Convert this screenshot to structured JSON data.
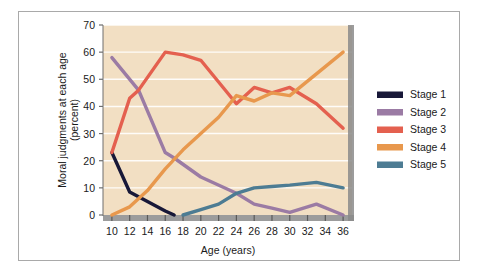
{
  "chart_data": {
    "type": "line",
    "title": "",
    "xlabel": "Age (years)",
    "ylabel": "Moral judgments at each age (percent)",
    "ylabel_line1": "Moral judgments at each age",
    "ylabel_line2": "(percent)",
    "xlim": [
      9,
      37
    ],
    "ylim": [
      0,
      70
    ],
    "xticks": [
      10,
      12,
      14,
      16,
      18,
      20,
      22,
      24,
      26,
      28,
      30,
      32,
      34,
      36
    ],
    "xtick_labels": [
      "10",
      "12",
      "14",
      "16",
      "18",
      "20",
      "22",
      "24",
      "26",
      "28",
      "30",
      "32",
      "34",
      "36"
    ],
    "yticks": [
      0,
      10,
      20,
      30,
      40,
      50,
      60,
      70
    ],
    "ytick_labels": [
      "0",
      "10",
      "20",
      "30",
      "40",
      "50",
      "60",
      "70"
    ],
    "grid": true,
    "grid_color": "#ffffff",
    "plot_background": "#f2dfc3",
    "legend_position": "right",
    "series": [
      {
        "name": "Stage 1",
        "color": "#181838",
        "points": [
          [
            10,
            23
          ],
          [
            12,
            8.5
          ],
          [
            14,
            5
          ],
          [
            16,
            1.5
          ],
          [
            17,
            0
          ]
        ]
      },
      {
        "name": "Stage 2",
        "color": "#9b7ba4",
        "points": [
          [
            10,
            58
          ],
          [
            13,
            46
          ],
          [
            16,
            23
          ],
          [
            17,
            21
          ],
          [
            20,
            14
          ],
          [
            24,
            8
          ],
          [
            26,
            4
          ],
          [
            28,
            2.5
          ],
          [
            30,
            1
          ],
          [
            32,
            3
          ],
          [
            33,
            4
          ],
          [
            36,
            0
          ]
        ]
      },
      {
        "name": "Stage 3",
        "color": "#e4604f",
        "points": [
          [
            10,
            23
          ],
          [
            12,
            43
          ],
          [
            13,
            46
          ],
          [
            16,
            60
          ],
          [
            18,
            59
          ],
          [
            20,
            57
          ],
          [
            24,
            41
          ],
          [
            26,
            47
          ],
          [
            28,
            45
          ],
          [
            30,
            47
          ],
          [
            33,
            41
          ],
          [
            36,
            32
          ]
        ]
      },
      {
        "name": "Stage 4",
        "color": "#e8984d",
        "points": [
          [
            10,
            0
          ],
          [
            12,
            3
          ],
          [
            14,
            9
          ],
          [
            16,
            17
          ],
          [
            18,
            24
          ],
          [
            20,
            30
          ],
          [
            22,
            36
          ],
          [
            24,
            44
          ],
          [
            26,
            42
          ],
          [
            28,
            45
          ],
          [
            30,
            44
          ],
          [
            33,
            52
          ],
          [
            36,
            60
          ]
        ]
      },
      {
        "name": "Stage 5",
        "color": "#4d7c93",
        "points": [
          [
            18,
            0
          ],
          [
            20,
            2
          ],
          [
            22,
            4
          ],
          [
            24,
            8
          ],
          [
            26,
            10
          ],
          [
            28,
            10.5
          ],
          [
            30,
            11
          ],
          [
            33,
            12
          ],
          [
            36,
            10
          ]
        ]
      }
    ]
  },
  "legend": {
    "items": [
      {
        "label": "Stage 1",
        "color": "#181838"
      },
      {
        "label": "Stage 2",
        "color": "#9b7ba4"
      },
      {
        "label": "Stage 3",
        "color": "#e4604f"
      },
      {
        "label": "Stage 4",
        "color": "#e8984d"
      },
      {
        "label": "Stage 5",
        "color": "#4d7c93"
      }
    ]
  },
  "colors": {
    "plot_background": "#f2dfc3",
    "grid": "#ffffff",
    "axis": "#6e6e6e",
    "frame_border": "#a9a9a9",
    "text": "#1a1a1a",
    "page_background": "#ffffff"
  }
}
